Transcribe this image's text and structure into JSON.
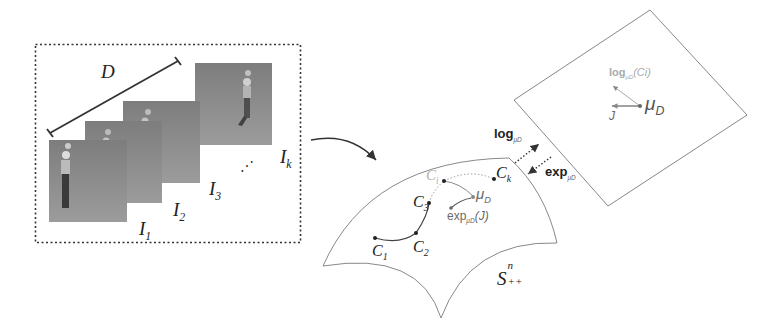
{
  "figure": {
    "sequence_box": {
      "distance_label": "D",
      "frames": [
        {
          "label_main": "I",
          "label_sub": "1"
        },
        {
          "label_main": "I",
          "label_sub": "2"
        },
        {
          "label_main": "I",
          "label_sub": "3"
        },
        {
          "label_main": "I",
          "label_sub": "k"
        }
      ],
      "ellipsis": "⋰"
    },
    "manifold": {
      "label_main": "S",
      "label_sup": "n",
      "label_sub": "++",
      "points": [
        {
          "main": "C",
          "sub": "1"
        },
        {
          "main": "C",
          "sub": "2"
        },
        {
          "main": "C",
          "sub": "3"
        },
        {
          "main": "C",
          "sub": "i"
        },
        {
          "main": "C",
          "sub": "k"
        }
      ],
      "mean_label_main": "μ",
      "mean_label_sub": "D",
      "exp_label": "exp",
      "exp_sub": "μD",
      "exp_arg": "(J)"
    },
    "maps": {
      "log_label": "log",
      "log_sub": "μD",
      "exp_label": "exp",
      "exp_sub": "μD"
    },
    "tangent_plane": {
      "mean_label_main": "μ",
      "mean_label_sub": "D",
      "j_label": "J",
      "log_label": "log",
      "log_sub": "μD",
      "log_arg": "(Ci)"
    },
    "colors": {
      "line": "#333333",
      "light_line": "#999999",
      "frame_gray": "#8a8a8a",
      "faded_text": "#9a9a9a"
    }
  }
}
